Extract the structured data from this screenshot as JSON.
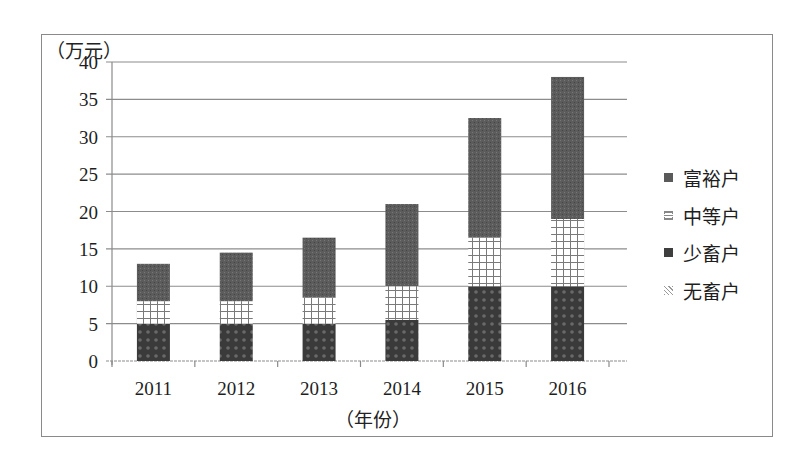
{
  "chart_data": {
    "type": "bar",
    "stacked": true,
    "title": "",
    "xlabel": "（年份）",
    "ylabel": "（万元）",
    "categories": [
      "2011",
      "2012",
      "2013",
      "2014",
      "2015",
      "2016"
    ],
    "series": [
      {
        "name": "无畜户",
        "values": [
          0,
          0,
          0,
          0,
          0,
          0
        ]
      },
      {
        "name": "少畜户",
        "values": [
          5,
          5,
          5,
          5.5,
          10,
          10
        ]
      },
      {
        "name": "中等户",
        "values": [
          3,
          3,
          3.5,
          4.5,
          6.5,
          9
        ]
      },
      {
        "name": "富裕户",
        "values": [
          5,
          6.5,
          8,
          11,
          16,
          19
        ]
      }
    ],
    "stack_totals": [
      13,
      14.5,
      16.5,
      21,
      32.5,
      38
    ],
    "ylim": [
      0,
      40
    ],
    "yticks": [
      0,
      5,
      10,
      15,
      20,
      25,
      30,
      35,
      40
    ],
    "grid": true,
    "legend_position": "right",
    "legend": [
      "富裕户",
      "中等户",
      "少畜户",
      "无畜户"
    ]
  },
  "colors": {
    "rich": "#5a5a5a",
    "mid_grid": "#8a8a8a",
    "few": "#3e3e3e",
    "gridline": "#8c8c8c",
    "frame": "#8a8a8a"
  }
}
